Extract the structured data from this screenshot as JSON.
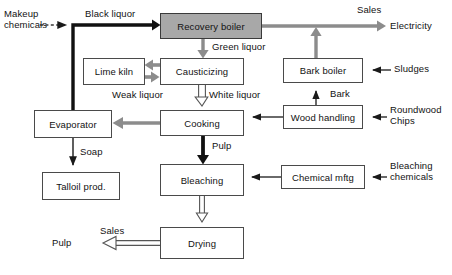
{
  "diagram": {
    "type": "process-flow",
    "colors": {
      "box_fill": "#ffffff",
      "box_stroke": "#4a4a4a",
      "shaded_box_fill": "#a8a8a8",
      "text": "#121212",
      "gray_arrow": "#8c8c8c",
      "black_arrow": "#111111",
      "hollow_arrow_stroke": "#555555"
    },
    "nodes": [
      {
        "id": "recovery_boiler",
        "label": "Recovery boiler",
        "shaded": true,
        "x": 160,
        "y": 13,
        "w": 102,
        "h": 26
      },
      {
        "id": "lime_kiln",
        "label": "Lime kiln",
        "shaded": false,
        "x": 83,
        "y": 58,
        "w": 62,
        "h": 27
      },
      {
        "id": "causticizing",
        "label": "Causticizing",
        "shaded": false,
        "x": 160,
        "y": 58,
        "w": 84,
        "h": 27
      },
      {
        "id": "bark_boiler",
        "label": "Bark boiler",
        "shaded": false,
        "x": 283,
        "y": 58,
        "w": 80,
        "h": 25
      },
      {
        "id": "evaporator",
        "label": "Evaporator",
        "shaded": false,
        "x": 34,
        "y": 110,
        "w": 78,
        "h": 28
      },
      {
        "id": "cooking",
        "label": "Cooking",
        "shaded": false,
        "x": 160,
        "y": 110,
        "w": 84,
        "h": 26
      },
      {
        "id": "wood_handling",
        "label": "Wood handling",
        "shaded": false,
        "x": 283,
        "y": 105,
        "w": 80,
        "h": 24
      },
      {
        "id": "talloil_prod",
        "label": "Talloil prod.",
        "shaded": false,
        "x": 42,
        "y": 172,
        "w": 78,
        "h": 28
      },
      {
        "id": "bleaching",
        "label": "Bleaching",
        "shaded": false,
        "x": 160,
        "y": 164,
        "w": 84,
        "h": 32
      },
      {
        "id": "chemical_mftg",
        "label": "Chemical mftg",
        "shaded": false,
        "x": 281,
        "y": 165,
        "w": 84,
        "h": 24
      },
      {
        "id": "drying",
        "label": "Drying",
        "shaded": false,
        "x": 160,
        "y": 227,
        "w": 84,
        "h": 32
      }
    ],
    "flow_labels": [
      {
        "id": "makeup_chemicals",
        "text": "Makeup\nchemicals",
        "x": 4,
        "y": 8,
        "align": "left"
      },
      {
        "id": "black_liquor",
        "text": "Black liquor",
        "x": 85,
        "y": 8,
        "align": "left"
      },
      {
        "id": "sales_top",
        "text": "Sales",
        "x": 357,
        "y": 4,
        "align": "left"
      },
      {
        "id": "electricity",
        "text": "Electricity",
        "x": 390,
        "y": 22,
        "align": "left"
      },
      {
        "id": "green_liquor",
        "text": "Green liquor",
        "x": 212,
        "y": 43,
        "align": "left"
      },
      {
        "id": "sludges",
        "text": "Sludges",
        "x": 394,
        "y": 63,
        "align": "left"
      },
      {
        "id": "weak_liquor",
        "text": "Weak liquor",
        "x": 112,
        "y": 90,
        "align": "left"
      },
      {
        "id": "white_liquor",
        "text": "White liquor",
        "x": 209,
        "y": 90,
        "align": "left"
      },
      {
        "id": "bark",
        "text": "Bark",
        "x": 330,
        "y": 88,
        "align": "left"
      },
      {
        "id": "roundwood_chips",
        "text": "Roundwood\nChips",
        "x": 390,
        "y": 104,
        "align": "left"
      },
      {
        "id": "pulp_cooking",
        "text": "Pulp",
        "x": 212,
        "y": 142,
        "align": "left"
      },
      {
        "id": "soap",
        "text": "Soap",
        "x": 80,
        "y": 148,
        "align": "left"
      },
      {
        "id": "bleaching_chemicals",
        "text": "Bleaching\nchemicals",
        "x": 390,
        "y": 160,
        "align": "left"
      },
      {
        "id": "sales_pulp",
        "text": "Sales",
        "x": 100,
        "y": 226,
        "align": "left"
      },
      {
        "id": "pulp_out",
        "text": "Pulp",
        "x": 52,
        "y": 241,
        "align": "left"
      }
    ],
    "edges": [
      {
        "id": "makeup-to-blackliquor-line",
        "from": "Makeup chemicals",
        "to": "black liquor line",
        "style": "dashed-thin-black"
      },
      {
        "id": "evaporator-to-recovery",
        "from": "Evaporator",
        "to": "Recovery boiler",
        "style": "thick-black",
        "label": "Black liquor"
      },
      {
        "id": "recovery-to-electricity",
        "from": "Recovery boiler",
        "to": "Electricity",
        "style": "thick-gray",
        "label": "Sales"
      },
      {
        "id": "recovery-to-causticizing",
        "from": "Recovery boiler",
        "to": "Causticizing",
        "style": "thick-gray",
        "label": "Green liquor"
      },
      {
        "id": "causticizing-to-limekiln",
        "from": "Causticizing",
        "to": "Lime kiln",
        "style": "thick-gray"
      },
      {
        "id": "limekiln-to-causticizing",
        "from": "Lime kiln",
        "to": "Causticizing",
        "style": "thick-gray"
      },
      {
        "id": "causticizing-to-cooking",
        "from": "Causticizing",
        "to": "Cooking",
        "style": "hollow-outline",
        "label": "White liquor"
      },
      {
        "id": "cooking-to-evaporator",
        "from": "Cooking",
        "to": "Evaporator",
        "style": "thick-gray",
        "label": "Weak liquor"
      },
      {
        "id": "evaporator-to-talloil",
        "from": "Evaporator",
        "to": "Talloil prod.",
        "style": "thin-black",
        "label": "Soap"
      },
      {
        "id": "cooking-to-bleaching",
        "from": "Cooking",
        "to": "Bleaching",
        "style": "thick-black",
        "label": "Pulp"
      },
      {
        "id": "bleaching-to-drying",
        "from": "Bleaching",
        "to": "Drying",
        "style": "hollow-outline"
      },
      {
        "id": "drying-to-pulp",
        "from": "Drying",
        "to": "Pulp",
        "style": "hollow-outline",
        "label": "Sales"
      },
      {
        "id": "chemicalmftg-to-bleaching",
        "from": "Chemical mftg",
        "to": "Bleaching",
        "style": "thin-black"
      },
      {
        "id": "bleachchem-to-chemicalmftg",
        "from": "Bleaching chemicals",
        "to": "Chemical mftg",
        "style": "thin-black"
      },
      {
        "id": "woodhandling-to-cooking",
        "from": "Wood handling",
        "to": "Cooking",
        "style": "thin-black"
      },
      {
        "id": "roundwood-to-woodhandling",
        "from": "Roundwood Chips",
        "to": "Wood handling",
        "style": "thin-black"
      },
      {
        "id": "woodhandling-to-barkboiler",
        "from": "Wood handling",
        "to": "Bark boiler",
        "style": "thin-black",
        "label": "Bark"
      },
      {
        "id": "sludges-to-barkboiler",
        "from": "Sludges",
        "to": "Bark boiler",
        "style": "thin-black"
      },
      {
        "id": "barkboiler-to-electricityline",
        "from": "Bark boiler",
        "to": "Electricity line",
        "style": "thick-gray"
      }
    ]
  }
}
